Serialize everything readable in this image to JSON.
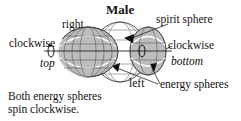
{
  "diagram": {
    "title": "Male",
    "labels": {
      "right": "right",
      "spirit_sphere": "spirit sphere",
      "clockwise_left": "clockwise",
      "clockwise_right": "clockwise",
      "top": "top",
      "bottom": "bottom",
      "left": "left",
      "energy_spheres": "energy spheres"
    },
    "caption": {
      "line1": "Both energy spheres",
      "line2": "spin clockwise."
    },
    "colors": {
      "energy_sphere_fill": "#bdbdbd",
      "spirit_sphere_fill": "#ffffff",
      "line": "#222222",
      "arrow": "#111111"
    }
  }
}
